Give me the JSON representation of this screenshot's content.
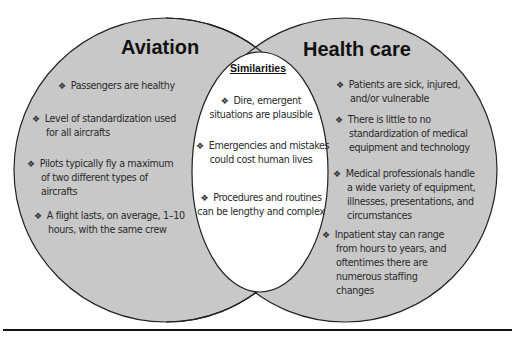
{
  "diagram": {
    "type": "venn",
    "colors": {
      "circle_fill": "#c8c8c8",
      "overlap_fill": "#ffffff",
      "outline": "#222222",
      "text": "#2a2a2a",
      "rule": "#111111"
    },
    "bullet_glyph": "❖",
    "left": {
      "title": "Aviation",
      "items": [
        {
          "lines": [
            "Passengers are healthy"
          ]
        },
        {
          "lines": [
            "Level of standardization used",
            "for all aircrafts"
          ]
        },
        {
          "lines": [
            "Pilots typically fly a maximum",
            "of two different types of",
            "aircrafts"
          ]
        },
        {
          "lines": [
            "A flight lasts, on average, 1–10",
            "hours, with the same crew"
          ]
        }
      ]
    },
    "center": {
      "title": "Similarities",
      "items": [
        {
          "lines": [
            "Dire, emergent",
            "situations are plausible"
          ]
        },
        {
          "lines": [
            "Emergencies and mistakes",
            "could cost human lives"
          ]
        },
        {
          "lines": [
            "Procedures and routines",
            "can be lengthy and complex"
          ]
        }
      ]
    },
    "right": {
      "title": "Health care",
      "items": [
        {
          "lines": [
            "Patients are sick, injured,",
            "and/or vulnerable"
          ]
        },
        {
          "lines": [
            "There is little to no",
            "standardization of medical",
            "equipment and technology"
          ]
        },
        {
          "lines": [
            "Medical professionals handle",
            "a wide variety of equipment,",
            "illnesses, presentations, and",
            "circumstances"
          ]
        },
        {
          "lines": [
            "Inpatient stay can range",
            "from hours to years, and",
            "oftentimes there are",
            "numerous staffing",
            "changes"
          ]
        }
      ]
    }
  }
}
